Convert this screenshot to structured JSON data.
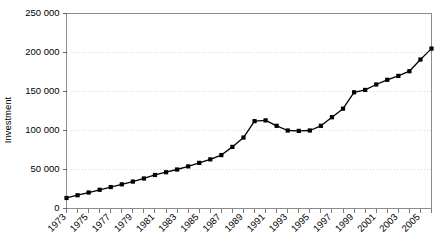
{
  "chart_data": {
    "type": "line",
    "title": "",
    "subtitle": "",
    "xlabel": "",
    "ylabel": "Investment",
    "ylim": [
      0,
      250000
    ],
    "xlim": [
      1973,
      2006
    ],
    "grid": "horizontal-dotted",
    "legend": "none",
    "y_tick_labels": [
      "0",
      "50 000",
      "100 000",
      "150 000",
      "200 000",
      "250 000"
    ],
    "y_tick_values": [
      0,
      50000,
      100000,
      150000,
      200000,
      250000
    ],
    "x_tick_labels": [
      "1973",
      "1975",
      "1977",
      "1979",
      "1981",
      "1983",
      "1985",
      "1987",
      "1989",
      "1991",
      "1993",
      "1995",
      "1997",
      "1999",
      "2001",
      "2003",
      "2005"
    ],
    "x_tick_label_values": [
      1973,
      1975,
      1977,
      1979,
      1981,
      1983,
      1985,
      1987,
      1989,
      1991,
      1993,
      1995,
      1997,
      1999,
      2001,
      2003,
      2005
    ],
    "x_minor_ticks": [
      1973,
      1974,
      1975,
      1976,
      1977,
      1978,
      1979,
      1980,
      1981,
      1982,
      1983,
      1984,
      1985,
      1986,
      1987,
      1988,
      1989,
      1990,
      1991,
      1992,
      1993,
      1994,
      1995,
      1996,
      1997,
      1998,
      1999,
      2000,
      2001,
      2002,
      2003,
      2004,
      2005,
      2006
    ],
    "x_tick_label_rotation": -45,
    "marker": "square",
    "marker_color": "#000000",
    "line_color": "#000000",
    "x": [
      1973,
      1974,
      1975,
      1976,
      1977,
      1978,
      1979,
      1980,
      1981,
      1982,
      1983,
      1984,
      1985,
      1986,
      1987,
      1988,
      1989,
      1990,
      1991,
      1992,
      1993,
      1994,
      1995,
      1996,
      1997,
      1998,
      1999,
      2000,
      2001,
      2002,
      2003,
      2004,
      2005,
      2006
    ],
    "values": [
      13500,
      17000,
      20500,
      24000,
      27500,
      31000,
      34500,
      38500,
      43000,
      46500,
      50000,
      54000,
      58500,
      63000,
      68500,
      79000,
      91000,
      112000,
      113000,
      106000,
      100000,
      99500,
      100000,
      106000,
      117000,
      128000,
      149000,
      152000,
      159000,
      165000,
      170000,
      176000,
      191000,
      205000
    ],
    "series": [
      {
        "name": "Investment",
        "values": [
          13500,
          17000,
          20500,
          24000,
          27500,
          31000,
          34500,
          38500,
          43000,
          46500,
          50000,
          54000,
          58500,
          63000,
          68500,
          79000,
          91000,
          112000,
          113000,
          106000,
          100000,
          99500,
          100000,
          106000,
          117000,
          128000,
          149000,
          152000,
          159000,
          165000,
          170000,
          176000,
          191000,
          205000
        ]
      }
    ]
  }
}
